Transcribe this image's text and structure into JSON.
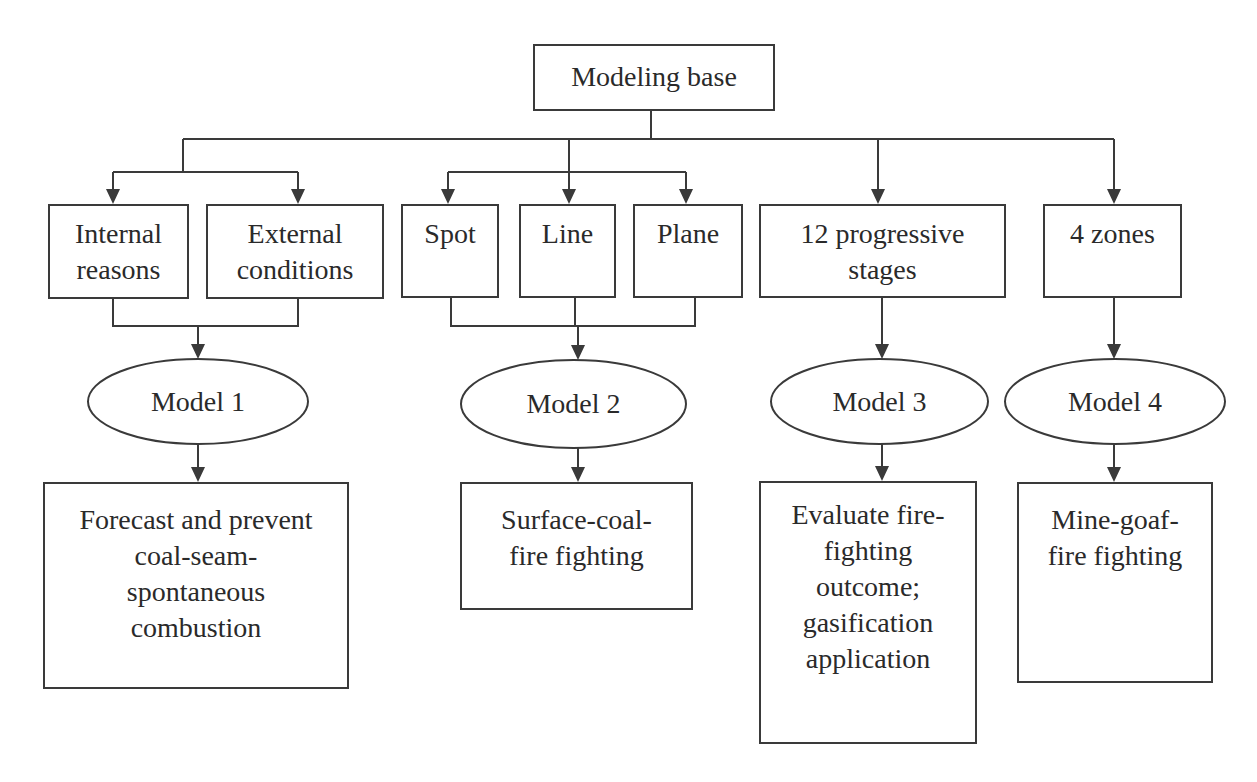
{
  "diagram": {
    "title": "Modeling base",
    "colors": {
      "line": "#3a3a3a",
      "text": "#2a2a2a",
      "background": "#ffffff"
    },
    "nodes": {
      "root": {
        "label": "Modeling base",
        "shape": "box",
        "x": 533,
        "y": 44,
        "w": 242,
        "h": 67,
        "pad": 13
      },
      "internal": {
        "label": "Internal\nreasons",
        "shape": "box",
        "x": 48,
        "y": 204,
        "w": 141,
        "h": 95,
        "pad": 10
      },
      "external": {
        "label": "External\nconditions",
        "shape": "box",
        "x": 206,
        "y": 204,
        "w": 178,
        "h": 95,
        "pad": 10
      },
      "spot": {
        "label": "Spot",
        "shape": "box",
        "x": 401,
        "y": 204,
        "w": 98,
        "h": 94,
        "pad": 10
      },
      "line": {
        "label": "Line",
        "shape": "box",
        "x": 519,
        "y": 204,
        "w": 97,
        "h": 94,
        "pad": 10
      },
      "plane": {
        "label": "Plane",
        "shape": "box",
        "x": 633,
        "y": 204,
        "w": 110,
        "h": 94,
        "pad": 10
      },
      "stages": {
        "label": "12 progressive\nstages",
        "shape": "box",
        "x": 759,
        "y": 204,
        "w": 247,
        "h": 94,
        "pad": 10
      },
      "zones": {
        "label": "4 zones",
        "shape": "box",
        "x": 1043,
        "y": 204,
        "w": 139,
        "h": 94,
        "pad": 10
      },
      "model1": {
        "label": "Model 1",
        "shape": "ellipse",
        "x": 88,
        "y": 359,
        "w": 220,
        "h": 85
      },
      "model2": {
        "label": "Model 2",
        "shape": "ellipse",
        "x": 461,
        "y": 360,
        "w": 225,
        "h": 88
      },
      "model3": {
        "label": "Model 3",
        "shape": "ellipse",
        "x": 771,
        "y": 359,
        "w": 217,
        "h": 85
      },
      "model4": {
        "label": "Model 4",
        "shape": "ellipse",
        "x": 1005,
        "y": 359,
        "w": 220,
        "h": 85
      },
      "out1": {
        "label": "Forecast and prevent\ncoal-seam-\nspontaneous\ncombustion",
        "shape": "box",
        "x": 43,
        "y": 482,
        "w": 306,
        "h": 207,
        "pad": 18
      },
      "out2": {
        "label": "Surface-coal-\nfire fighting",
        "shape": "box",
        "x": 460,
        "y": 482,
        "w": 233,
        "h": 128,
        "pad": 18
      },
      "out3": {
        "label": "Evaluate fire-\nfighting\noutcome;\ngasification\napplication",
        "shape": "box",
        "x": 759,
        "y": 481,
        "w": 218,
        "h": 263,
        "pad": 14
      },
      "out4": {
        "label": "Mine-goaf-\nfire fighting",
        "shape": "box",
        "x": 1017,
        "y": 482,
        "w": 196,
        "h": 201,
        "pad": 18
      }
    },
    "lines": [
      [
        [
          651,
          111
        ],
        [
          651,
          139
        ]
      ],
      [
        [
          183,
          139
        ],
        [
          1114,
          139
        ]
      ],
      [
        [
          183,
          139
        ],
        [
          183,
          172
        ]
      ],
      [
        [
          113,
          172
        ],
        [
          298,
          172
        ]
      ],
      [
        [
          448,
          172
        ],
        [
          686,
          172
        ]
      ],
      [
        [
          569,
          139
        ],
        [
          569,
          172
        ]
      ],
      [
        [
          113,
          299
        ],
        [
          113,
          326
        ],
        [
          298,
          326
        ],
        [
          298,
          299
        ]
      ],
      [
        [
          451,
          298
        ],
        [
          451,
          326
        ],
        [
          695,
          326
        ],
        [
          695,
          298
        ]
      ],
      [
        [
          575,
          298
        ],
        [
          575,
          326
        ]
      ]
    ],
    "arrows": [
      [
        [
          113,
          172
        ],
        [
          113,
          204
        ]
      ],
      [
        [
          298,
          172
        ],
        [
          298,
          204
        ]
      ],
      [
        [
          448,
          172
        ],
        [
          448,
          204
        ]
      ],
      [
        [
          569,
          172
        ],
        [
          569,
          204
        ]
      ],
      [
        [
          686,
          172
        ],
        [
          686,
          204
        ]
      ],
      [
        [
          878,
          139
        ],
        [
          878,
          204
        ]
      ],
      [
        [
          1114,
          139
        ],
        [
          1114,
          204
        ]
      ],
      [
        [
          198,
          326
        ],
        [
          198,
          359
        ]
      ],
      [
        [
          578,
          326
        ],
        [
          578,
          360
        ]
      ],
      [
        [
          882,
          298
        ],
        [
          882,
          359
        ]
      ],
      [
        [
          1114,
          298
        ],
        [
          1114,
          359
        ]
      ],
      [
        [
          198,
          444
        ],
        [
          198,
          482
        ]
      ],
      [
        [
          578,
          448
        ],
        [
          578,
          482
        ]
      ],
      [
        [
          882,
          444
        ],
        [
          882,
          481
        ]
      ],
      [
        [
          1114,
          444
        ],
        [
          1114,
          482
        ]
      ]
    ]
  }
}
